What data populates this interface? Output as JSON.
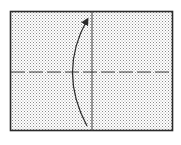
{
  "diagram": {
    "type": "origami-fold-instruction",
    "paper": {
      "x": 10,
      "y": 11,
      "width": 163,
      "height": 120,
      "fill": "stippled-gray",
      "border_color": "#2a2a2a"
    },
    "crease_vertical": {
      "x": 92,
      "y1": 11,
      "y2": 131,
      "style": "solid"
    },
    "fold_line_horizontal": {
      "y": 72,
      "x1": 10,
      "x2": 173,
      "style": "dashed",
      "meaning": "valley-fold"
    },
    "arrow": {
      "direction": "up",
      "shape": "curved",
      "start": [
        87,
        126
      ],
      "apex": [
        71,
        72
      ],
      "end": [
        88,
        18
      ],
      "meaning": "fold bottom half up"
    },
    "colors": {
      "line": "#2a2a2a",
      "dot": "#8a8a8a",
      "background": "#ffffff"
    }
  },
  "caption": {
    "text": ""
  }
}
